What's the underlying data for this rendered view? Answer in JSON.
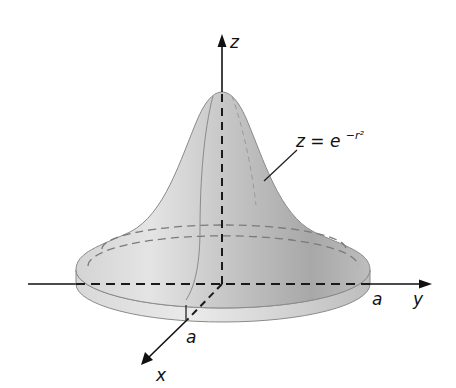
{
  "figure": {
    "equation": {
      "lhs": "z = e",
      "exponent": "−r²",
      "full": "z = e^{−r²}"
    },
    "axes": {
      "z_label": "z",
      "y_label": "y",
      "x_label": "x"
    },
    "radius_labels": {
      "x_axis": "a",
      "y_axis": "a"
    },
    "colors": {
      "surface_light": "#e2e2e2",
      "surface_mid": "#bcbcbc",
      "surface_dark": "#9a9a9a",
      "edge": "#8a8a8a",
      "axis": "#111111",
      "dash": "#222222",
      "hidden_dash": "#777777"
    }
  }
}
